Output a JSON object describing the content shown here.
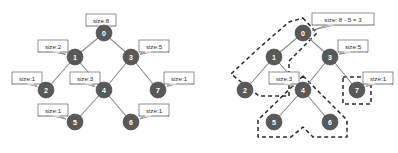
{
  "figure": {
    "node_fill": "#595959",
    "node_text_color": "#ffffff",
    "edge_color": "#8a8a8a",
    "callout_border": "#777777",
    "group_outline_color": "#2b2b2b",
    "background": "#ffffff"
  },
  "panels": [
    {
      "id": "left",
      "name": "tree-with-sizes",
      "nodes": [
        {
          "id": "0",
          "label": "0",
          "x": 104,
          "y": 33,
          "r": 8
        },
        {
          "id": "1",
          "label": "1",
          "x": 75,
          "y": 57,
          "r": 8
        },
        {
          "id": "3",
          "label": "3",
          "x": 131,
          "y": 57,
          "r": 8
        },
        {
          "id": "2",
          "label": "2",
          "x": 46,
          "y": 90,
          "r": 8
        },
        {
          "id": "4",
          "label": "4",
          "x": 104,
          "y": 90,
          "r": 8
        },
        {
          "id": "7",
          "label": "7",
          "x": 158,
          "y": 90,
          "r": 8
        },
        {
          "id": "5",
          "label": "5",
          "x": 75,
          "y": 122,
          "r": 8
        },
        {
          "id": "6",
          "label": "6",
          "x": 131,
          "y": 122,
          "r": 8
        }
      ],
      "edges": [
        {
          "from": "0",
          "to": "1"
        },
        {
          "from": "0",
          "to": "3"
        },
        {
          "from": "1",
          "to": "2"
        },
        {
          "from": "1",
          "to": "4"
        },
        {
          "from": "3",
          "to": "4"
        },
        {
          "from": "3",
          "to": "7"
        },
        {
          "from": "4",
          "to": "5"
        },
        {
          "from": "4",
          "to": "6"
        }
      ],
      "callouts": [
        {
          "for": "0",
          "text": "size:8",
          "x": 86,
          "y": 14,
          "w": 30,
          "h": 12,
          "tail": "br"
        },
        {
          "for": "1",
          "text": "size:2",
          "x": 38,
          "y": 40,
          "w": 30,
          "h": 12,
          "tail": "br"
        },
        {
          "for": "3",
          "text": "size:5",
          "x": 139,
          "y": 40,
          "w": 30,
          "h": 12,
          "tail": "bl"
        },
        {
          "for": "2",
          "text": "size:1",
          "x": 12,
          "y": 72,
          "w": 30,
          "h": 12,
          "tail": "br"
        },
        {
          "for": "4",
          "text": "size:3",
          "x": 70,
          "y": 72,
          "w": 30,
          "h": 12,
          "tail": "br"
        },
        {
          "for": "7",
          "text": "size:1",
          "x": 164,
          "y": 72,
          "w": 30,
          "h": 12,
          "tail": "bl"
        },
        {
          "for": "5",
          "text": "size:1",
          "x": 38,
          "y": 104,
          "w": 30,
          "h": 12,
          "tail": "br"
        },
        {
          "for": "6",
          "text": "size:1",
          "x": 139,
          "y": 104,
          "w": 30,
          "h": 12,
          "tail": "bl"
        }
      ],
      "groups": []
    },
    {
      "id": "right",
      "name": "tree-with-subtraction",
      "nodes": [
        {
          "id": "0",
          "label": "0",
          "x": 104,
          "y": 33,
          "r": 8
        },
        {
          "id": "1",
          "label": "1",
          "x": 75,
          "y": 57,
          "r": 8
        },
        {
          "id": "3",
          "label": "3",
          "x": 131,
          "y": 57,
          "r": 8
        },
        {
          "id": "2",
          "label": "2",
          "x": 46,
          "y": 90,
          "r": 8
        },
        {
          "id": "4",
          "label": "4",
          "x": 104,
          "y": 90,
          "r": 8
        },
        {
          "id": "7",
          "label": "7",
          "x": 158,
          "y": 90,
          "r": 8
        },
        {
          "id": "5",
          "label": "5",
          "x": 75,
          "y": 122,
          "r": 8
        },
        {
          "id": "6",
          "label": "6",
          "x": 131,
          "y": 122,
          "r": 8
        }
      ],
      "edges": [
        {
          "from": "0",
          "to": "1"
        },
        {
          "from": "0",
          "to": "3"
        },
        {
          "from": "1",
          "to": "2"
        },
        {
          "from": "1",
          "to": "4"
        },
        {
          "from": "3",
          "to": "4"
        },
        {
          "from": "3",
          "to": "7"
        },
        {
          "from": "4",
          "to": "5"
        },
        {
          "from": "4",
          "to": "6"
        }
      ],
      "callouts": [
        {
          "for": "0",
          "text": "size: 8 - 5 = 3",
          "x": 113,
          "y": 13,
          "w": 62,
          "h": 12,
          "tail": "bl"
        },
        {
          "for": "3",
          "text": "size:5",
          "x": 139,
          "y": 40,
          "w": 30,
          "h": 12,
          "tail": "bl"
        },
        {
          "for": "4",
          "text": "size:3",
          "x": 70,
          "y": 72,
          "w": 30,
          "h": 12,
          "tail": "br"
        },
        {
          "for": "7",
          "text": "size:1",
          "x": 164,
          "y": 72,
          "w": 30,
          "h": 12,
          "tail": "bl"
        }
      ],
      "groups": [
        {
          "name": "group-root-chain",
          "members": [
            "0",
            "1",
            "2"
          ],
          "points": "104,18 118,33 90,61 90,96 60,96 32,74 60,48 90,22"
        },
        {
          "name": "group-subtree-4",
          "members": [
            "4",
            "5",
            "6"
          ],
          "points": "104,76 148,120 148,137 114,137 104,127 92,137 59,137 59,120"
        },
        {
          "name": "group-node-7",
          "members": [
            "7"
          ],
          "points": "144,77 172,77 172,104 144,104"
        }
      ]
    }
  ]
}
